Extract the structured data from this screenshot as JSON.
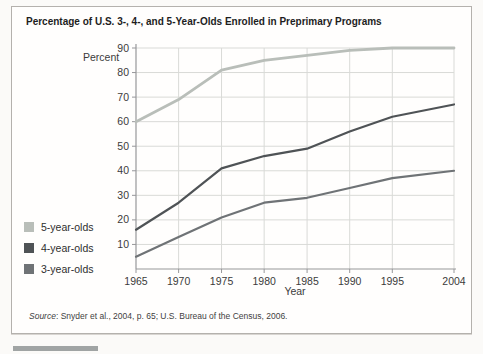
{
  "figure": {
    "title": "Percentage of U.S. 3-, 4-, and 5-Year-Olds Enrolled in Preprimary Programs",
    "source_label": "Source",
    "source_text": ": Snyder et al., 2004, p. 65; U.S. Bureau of the Census, 2006."
  },
  "chart_data": {
    "type": "line",
    "title": "Percentage of U.S. 3-, 4-, and 5-Year-Olds Enrolled in Preprimary Programs",
    "xlabel": "Year",
    "ylabel": "Percent",
    "categories": [
      "1965",
      "1970",
      "1975",
      "1980",
      "1985",
      "1990",
      "1995",
      "2004"
    ],
    "series": [
      {
        "name": "5-year-olds",
        "color": "#b9beb9",
        "stroke_width": 2.8,
        "values": [
          60,
          69,
          81,
          85,
          87,
          89,
          90,
          90
        ]
      },
      {
        "name": "4-year-olds",
        "color": "#4f5356",
        "stroke_width": 2.2,
        "values": [
          16,
          27,
          41,
          46,
          49,
          56,
          62,
          67
        ]
      },
      {
        "name": "3-year-olds",
        "color": "#6f7376",
        "stroke_width": 2.2,
        "values": [
          5,
          13,
          21,
          27,
          29,
          33,
          37,
          40
        ]
      }
    ],
    "ylim": [
      0,
      90
    ],
    "ytick_step": 10,
    "grid": true,
    "legend_position": "left",
    "colors": {
      "grid": "#d9dad7",
      "axis": "#97979a"
    }
  }
}
